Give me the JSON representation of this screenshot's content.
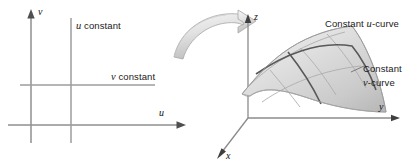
{
  "figure": {
    "title_alt": "Parameter plane mapping to a parametric surface",
    "background_color": "#ffffff"
  },
  "parameter_plane": {
    "name": "uv-parameter-plane",
    "axes": {
      "vertical_axis_label": "v",
      "horizontal_axis_label": "u",
      "axis_color": "#8a8a8a",
      "arrow_color": "#555555"
    },
    "gridlines": [
      {
        "id": "u-constant-line",
        "orientation": "vertical",
        "label": "u constant",
        "label_italic_part": "u",
        "label_rest": " constant",
        "color": "#9a9a9a"
      },
      {
        "id": "v-constant-line",
        "orientation": "horizontal",
        "label": "v constant",
        "label_italic_part": "v",
        "label_rest": " constant",
        "color": "#9a9a9a"
      }
    ]
  },
  "mapping_arrow": {
    "name": "curved-mapping-arrow",
    "direction": "left-to-right, arcing over and pointing down-right",
    "fill_light": "#f2f2f2",
    "fill_mid": "#dcdcdc",
    "fill_dark": "#b9b9b9",
    "outline_color": "#a0a0a0"
  },
  "surface_plot": {
    "name": "parametric-surface-3d",
    "axes": {
      "z_label": "z",
      "y_label": "y",
      "x_label": "x",
      "axis_color": "#8b8b8b",
      "arrow_color": "#4a4a4a"
    },
    "surface": {
      "fill_light": "#efefef",
      "fill_mid": "#d8d8d8",
      "fill_dark": "#bcbcbc",
      "edge_color": "#9e9e9e",
      "grid_color": "#a8a8a8",
      "highlight_curve_color": "#5a5a5a",
      "grid_rows": 3,
      "grid_cols": 4
    },
    "annotations": [
      {
        "id": "constant-u-curve-label",
        "text": "Constant u-curve",
        "prefix": "Constant ",
        "italic_part": "u",
        "suffix": "-curve",
        "lines": 1
      },
      {
        "id": "constant-v-curve-label",
        "text": "Constant v-curve",
        "line1": "Constant",
        "line2_italic": "v",
        "line2_rest": "-curve",
        "lines": 2
      }
    ]
  }
}
